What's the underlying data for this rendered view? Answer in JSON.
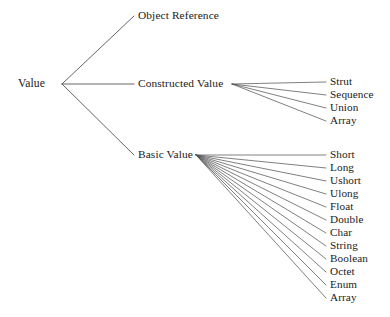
{
  "diagram": {
    "type": "tree",
    "background_color": "#ffffff",
    "line_color": "#555555",
    "text_color": "#1a1a1a",
    "root": {
      "label": "Value",
      "x": 18,
      "y": 84
    },
    "level1": [
      {
        "label": "Object Reference",
        "x": 138,
        "y": 16
      },
      {
        "label": "Constructed Value",
        "x": 138,
        "y": 84
      },
      {
        "label": "Basic Value",
        "x": 138,
        "y": 155
      }
    ],
    "constructed_children": [
      {
        "label": "Strut",
        "x": 330,
        "y": 82
      },
      {
        "label": "Sequence",
        "x": 330,
        "y": 95
      },
      {
        "label": "Union",
        "x": 330,
        "y": 108
      },
      {
        "label": "Array",
        "x": 330,
        "y": 121
      }
    ],
    "basic_children": [
      {
        "label": "Short",
        "x": 330,
        "y": 155
      },
      {
        "label": "Long",
        "x": 330,
        "y": 168
      },
      {
        "label": "Ushort",
        "x": 330,
        "y": 181
      },
      {
        "label": "Ulong",
        "x": 330,
        "y": 194
      },
      {
        "label": "Float",
        "x": 330,
        "y": 207
      },
      {
        "label": "Double",
        "x": 330,
        "y": 220
      },
      {
        "label": "Char",
        "x": 330,
        "y": 233
      },
      {
        "label": "String",
        "x": 330,
        "y": 246
      },
      {
        "label": "Boolean",
        "x": 330,
        "y": 259
      },
      {
        "label": "Octet",
        "x": 330,
        "y": 272
      },
      {
        "label": "Enum",
        "x": 330,
        "y": 285
      },
      {
        "label": "Array",
        "x": 330,
        "y": 298
      }
    ]
  }
}
